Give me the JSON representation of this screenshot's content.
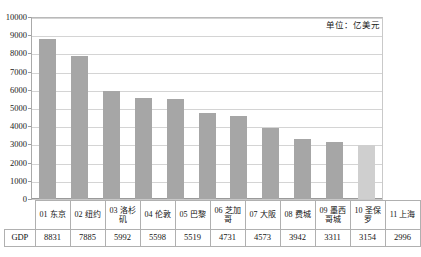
{
  "chart_data": {
    "type": "bar",
    "title": "",
    "subtitle": "",
    "unit_note": "单位：亿美元",
    "xlabel": "",
    "ylabel": "",
    "ylim": [
      0,
      10000
    ],
    "ytick_step": 1000,
    "yticks": [
      "10000",
      "9000",
      "8000",
      "7000",
      "6000",
      "5000",
      "4000",
      "3000",
      "2000",
      "1000",
      "0"
    ],
    "grid": true,
    "legend": "none",
    "row_header": "GDP",
    "categories": [
      "01 东京",
      "02 纽约",
      "03 洛杉矶",
      "04 伦敦",
      "05 巴黎",
      "06 芝加哥",
      "07 大阪",
      "08 费城",
      "09 墨西哥城",
      "10 圣保罗",
      "11 上海"
    ],
    "values": [
      8831,
      7885,
      5992,
      5598,
      5519,
      4731,
      4573,
      3942,
      3311,
      3154,
      2996
    ],
    "value_labels": [
      "8831",
      "7885",
      "5992",
      "5598",
      "5519",
      "4731",
      "4573",
      "3942",
      "3311",
      "3154",
      "2996"
    ],
    "bar_color": "#a6a6a6",
    "highlight_color": "#cfcfcf",
    "highlight_index": 10
  }
}
